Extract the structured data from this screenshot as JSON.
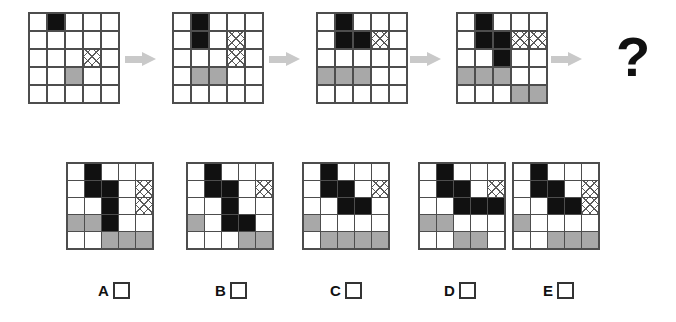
{
  "puzzle": {
    "type": "visual-sequence-analogy",
    "question_mark": "?",
    "colors": {
      "black": "#111111",
      "gray": "#a8a8a8",
      "hatch_line": "#5a5a5a",
      "grid_line": "#4d4d4d",
      "arrow": "#c9c9c9",
      "background": "#ffffff"
    },
    "grid_size": {
      "rows": 5,
      "cols": 5
    },
    "legend": {
      "0": "empty",
      "1": "black",
      "2": "gray",
      "3": "crosshatch"
    },
    "sequence": [
      {
        "name": "sequence-step-1",
        "cells": [
          [
            0,
            1,
            0,
            0,
            0
          ],
          [
            0,
            0,
            0,
            0,
            0
          ],
          [
            0,
            0,
            0,
            3,
            0
          ],
          [
            0,
            0,
            2,
            0,
            0
          ],
          [
            0,
            0,
            0,
            0,
            0
          ]
        ]
      },
      {
        "name": "sequence-step-2",
        "cells": [
          [
            0,
            1,
            0,
            0,
            0
          ],
          [
            0,
            1,
            0,
            3,
            0
          ],
          [
            0,
            0,
            0,
            3,
            0
          ],
          [
            0,
            2,
            2,
            0,
            0
          ],
          [
            0,
            0,
            0,
            0,
            0
          ]
        ]
      },
      {
        "name": "sequence-step-3",
        "cells": [
          [
            0,
            1,
            0,
            0,
            0
          ],
          [
            0,
            1,
            1,
            3,
            0
          ],
          [
            0,
            0,
            0,
            0,
            0
          ],
          [
            2,
            2,
            2,
            0,
            0
          ],
          [
            0,
            0,
            0,
            0,
            0
          ]
        ]
      },
      {
        "name": "sequence-step-4",
        "cells": [
          [
            0,
            1,
            0,
            0,
            0
          ],
          [
            0,
            1,
            1,
            3,
            3
          ],
          [
            0,
            0,
            1,
            0,
            0
          ],
          [
            2,
            2,
            2,
            0,
            0
          ],
          [
            0,
            0,
            0,
            2,
            2
          ]
        ]
      }
    ],
    "arrows": [
      {
        "name": "arrow-1"
      },
      {
        "name": "arrow-2"
      },
      {
        "name": "arrow-3"
      },
      {
        "name": "arrow-4"
      }
    ],
    "options": [
      {
        "label": "A",
        "name": "option-a",
        "cells": [
          [
            0,
            1,
            0,
            0,
            0
          ],
          [
            0,
            1,
            1,
            0,
            3
          ],
          [
            0,
            0,
            1,
            0,
            3
          ],
          [
            2,
            2,
            1,
            0,
            0
          ],
          [
            0,
            0,
            2,
            2,
            2
          ]
        ]
      },
      {
        "label": "B",
        "name": "option-b",
        "cells": [
          [
            0,
            1,
            0,
            0,
            0
          ],
          [
            0,
            1,
            1,
            0,
            3
          ],
          [
            0,
            0,
            1,
            0,
            0
          ],
          [
            2,
            0,
            1,
            1,
            0
          ],
          [
            0,
            0,
            0,
            2,
            2
          ]
        ]
      },
      {
        "label": "C",
        "name": "option-c",
        "cells": [
          [
            0,
            1,
            0,
            0,
            0
          ],
          [
            0,
            1,
            1,
            0,
            3
          ],
          [
            0,
            0,
            1,
            1,
            0
          ],
          [
            2,
            0,
            0,
            0,
            0
          ],
          [
            0,
            2,
            2,
            2,
            2
          ]
        ]
      },
      {
        "label": "D",
        "name": "option-d",
        "cells": [
          [
            0,
            1,
            0,
            0,
            0
          ],
          [
            0,
            1,
            1,
            0,
            3
          ],
          [
            0,
            0,
            1,
            1,
            1
          ],
          [
            2,
            2,
            0,
            0,
            0
          ],
          [
            0,
            0,
            2,
            2,
            0
          ]
        ]
      },
      {
        "label": "E",
        "name": "option-e",
        "cells": [
          [
            0,
            1,
            0,
            0,
            0
          ],
          [
            0,
            1,
            1,
            0,
            3
          ],
          [
            0,
            0,
            1,
            1,
            3
          ],
          [
            2,
            0,
            0,
            0,
            0
          ],
          [
            0,
            0,
            2,
            2,
            2
          ]
        ]
      }
    ]
  }
}
